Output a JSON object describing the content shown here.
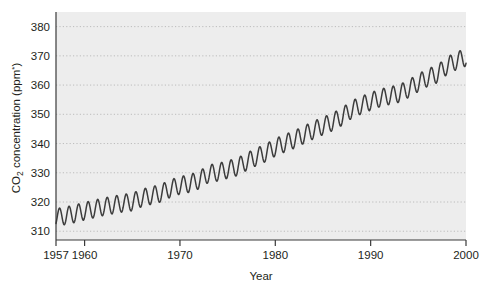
{
  "figure": {
    "background_color": "#ffffff",
    "plot_background_color": "#ededed",
    "gridline_color": "#bcbcbc",
    "axis_color": "#3a3a3a",
    "line_color": "#3c3c3c"
  },
  "axes": {
    "y_title_main": "CO",
    "y_title_sub": "2",
    "y_title_rest": " concentration (ppm",
    "y_title_star": "*",
    "y_title_close": ")",
    "y_title_full": "CO2 concentration (ppm*)",
    "x_title": "Year"
  },
  "chart_data": {
    "type": "line",
    "title": "",
    "xlabel": "Year",
    "ylabel": "CO2 concentration (ppm*)",
    "xlim": [
      1957,
      2000
    ],
    "ylim": [
      307,
      385
    ],
    "grid": true,
    "legend": null,
    "xticks": [
      1957,
      1960,
      1970,
      1980,
      1990,
      2000
    ],
    "xtick_labels": [
      "1957",
      "1960",
      "1970",
      "1980",
      "1990",
      "2000"
    ],
    "yticks": [
      310,
      320,
      330,
      340,
      350,
      360,
      370,
      380
    ],
    "ytick_labels": [
      "310",
      "320",
      "330",
      "340",
      "350",
      "360",
      "370",
      "380"
    ],
    "series": [
      {
        "name": "Atmospheric CO2 (Mauna Loa)",
        "annual_mean_x": [
          1957,
          1958,
          1959,
          1960,
          1961,
          1962,
          1963,
          1964,
          1965,
          1966,
          1967,
          1968,
          1969,
          1970,
          1971,
          1972,
          1973,
          1974,
          1975,
          1976,
          1977,
          1978,
          1979,
          1980,
          1981,
          1982,
          1983,
          1984,
          1985,
          1986,
          1987,
          1988,
          1989,
          1990,
          1991,
          1992,
          1993,
          1994,
          1995,
          1996,
          1997,
          1998,
          1999,
          2000
        ],
        "annual_mean_y": [
          314.7,
          315.3,
          316.0,
          316.9,
          317.6,
          318.4,
          319.0,
          319.6,
          320.0,
          321.4,
          322.2,
          323.0,
          324.6,
          325.7,
          326.3,
          327.5,
          329.7,
          330.2,
          331.1,
          332.0,
          333.8,
          335.4,
          336.8,
          338.7,
          340.1,
          341.4,
          343.0,
          344.6,
          346.0,
          347.4,
          349.2,
          351.6,
          353.1,
          354.4,
          355.6,
          356.4,
          357.1,
          358.8,
          360.8,
          362.6,
          363.8,
          366.6,
          368.3,
          369.5
        ],
        "seasonal_amplitude_ppm": 6.0,
        "seasonal_peak_month": "May",
        "seasonal_trough_month": "October",
        "start_value_ppm": 315,
        "end_value_ppm": 373,
        "total_rise_ppm": 58
      }
    ]
  },
  "geometry": {
    "plot_left": 56,
    "plot_right": 466,
    "plot_top": 12,
    "plot_bottom": 240
  }
}
